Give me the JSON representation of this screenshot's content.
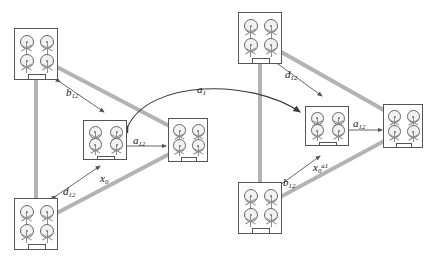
{
  "figure": {
    "type": "formation-control-diagram",
    "background_color": "#ffffff",
    "triangle_color": "#b3b3b3",
    "node_border_color": "#555555",
    "arrow_color": "#3a3a3a"
  },
  "labels": [
    {
      "id": "a1",
      "base": "a",
      "sub": "1",
      "sup": "",
      "x": 197,
      "y": 83,
      "name": "label-a1"
    },
    {
      "id": "b12-left",
      "base": "b",
      "sub": "12",
      "sup": "",
      "x": 66,
      "y": 86,
      "name": "label-b12-left"
    },
    {
      "id": "d12-left",
      "base": "d",
      "sub": "12",
      "sup": "",
      "x": 63,
      "y": 185,
      "name": "label-d12-left"
    },
    {
      "id": "a12-left",
      "base": "a",
      "sub": "12",
      "sup": "",
      "x": 133,
      "y": 134,
      "name": "label-a12-left"
    },
    {
      "id": "x0-left",
      "base": "x",
      "sub": "0",
      "sup": "",
      "x": 100,
      "y": 172,
      "name": "label-x0-left"
    },
    {
      "id": "d12-right",
      "base": "d",
      "sub": "12",
      "sup": "",
      "x": 285,
      "y": 68,
      "name": "label-d12-right"
    },
    {
      "id": "b12-right",
      "base": "b",
      "sub": "12",
      "sup": "",
      "x": 283,
      "y": 176,
      "name": "label-b12-right"
    },
    {
      "id": "a12-right",
      "base": "a",
      "sub": "12",
      "sup": "",
      "x": 353,
      "y": 117,
      "name": "label-a12-right"
    },
    {
      "id": "x0-right",
      "base": "x",
      "sub": "0",
      "sup": "a1",
      "x": 313,
      "y": 161,
      "name": "label-x0-star-right"
    }
  ],
  "nodes": [
    {
      "id": "L-top",
      "x": 14,
      "y": 28,
      "w": 44,
      "h": 52,
      "name": "robot-node-left-top"
    },
    {
      "id": "L-bottom",
      "x": 14,
      "y": 198,
      "w": 44,
      "h": 52,
      "name": "robot-node-left-bottom"
    },
    {
      "id": "L-mid",
      "x": 83,
      "y": 120,
      "w": 44,
      "h": 40,
      "name": "robot-node-left-middle"
    },
    {
      "id": "L-right",
      "x": 168,
      "y": 118,
      "w": 40,
      "h": 44,
      "name": "robot-node-left-right"
    },
    {
      "id": "R-top",
      "x": 238,
      "y": 12,
      "w": 44,
      "h": 52,
      "name": "robot-node-right-top"
    },
    {
      "id": "R-bottom",
      "x": 238,
      "y": 182,
      "w": 44,
      "h": 52,
      "name": "robot-node-right-bottom"
    },
    {
      "id": "R-mid",
      "x": 305,
      "y": 106,
      "w": 44,
      "h": 40,
      "name": "robot-node-right-middle"
    },
    {
      "id": "R-right",
      "x": 383,
      "y": 104,
      "w": 40,
      "h": 44,
      "name": "robot-node-right-right"
    }
  ],
  "triangles": [
    {
      "id": "left",
      "points": "36,56 36,224 196,140",
      "name": "formation-triangle-left"
    },
    {
      "id": "right",
      "points": "260,40 260,208 412,126",
      "name": "formation-triangle-right"
    }
  ],
  "arc": {
    "path": "M 128 126 C 150 80, 250 78, 300 112",
    "name": "bidirectional-arc-a1"
  },
  "measure_arrows": [
    {
      "id": "b12-left",
      "x1": 60,
      "y1": 82,
      "x2": 104,
      "y2": 112,
      "double": true,
      "name": "measure-arrow-b12-left"
    },
    {
      "id": "d12-left",
      "x1": 56,
      "y1": 196,
      "x2": 100,
      "y2": 166,
      "double": true,
      "name": "measure-arrow-d12-left"
    },
    {
      "id": "a12-left",
      "x1": 124,
      "y1": 146,
      "x2": 166,
      "y2": 146,
      "double": true,
      "name": "measure-arrow-a12-left"
    },
    {
      "id": "d12-right",
      "x1": 278,
      "y1": 64,
      "x2": 322,
      "y2": 96,
      "double": true,
      "name": "measure-arrow-d12-right"
    },
    {
      "id": "b12-right",
      "x1": 276,
      "y1": 188,
      "x2": 320,
      "y2": 156,
      "double": true,
      "name": "measure-arrow-b12-right"
    },
    {
      "id": "a12-right",
      "x1": 344,
      "y1": 130,
      "x2": 382,
      "y2": 130,
      "double": true,
      "name": "measure-arrow-a12-right"
    }
  ]
}
